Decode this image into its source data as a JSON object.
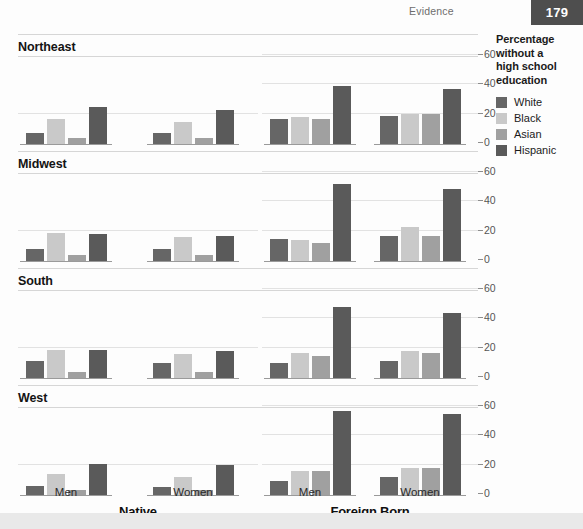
{
  "header": {
    "title": "Evidence",
    "page_number": "179"
  },
  "legend": {
    "title": "Percentage without a high school education",
    "title_lines": [
      "Percentage",
      "without a",
      "high school",
      "education"
    ],
    "items": [
      {
        "label": "White",
        "color": "#666666"
      },
      {
        "label": "Black",
        "color": "#c9c9c9"
      },
      {
        "label": "Asian",
        "color": "#a0a0a0"
      },
      {
        "label": "Hispanic",
        "color": "#5a5a5a"
      }
    ]
  },
  "axis": {
    "ticks": [
      "60",
      "40",
      "20",
      "0"
    ],
    "tick_values": [
      60,
      40,
      20,
      0
    ]
  },
  "bottom_labels": {
    "native": "Native",
    "foreign": "Foreign Born",
    "men": "Men",
    "women": "Women"
  },
  "regions": [
    {
      "name": "Northeast"
    },
    {
      "name": "Midwest"
    },
    {
      "name": "South"
    },
    {
      "name": "West"
    }
  ],
  "chart_data": {
    "type": "bar",
    "xlabel": "",
    "ylabel": "Percentage without a high school education",
    "ylim": [
      0,
      60
    ],
    "yticks": [
      0,
      20,
      40,
      60
    ],
    "grid": true,
    "legend_position": "right",
    "series_names": [
      "White",
      "Black",
      "Asian",
      "Hispanic"
    ],
    "series_colors": [
      "#666666",
      "#c9c9c9",
      "#a0a0a0",
      "#5a5a5a"
    ],
    "panel_rows": [
      "Northeast",
      "Midwest",
      "South",
      "West"
    ],
    "panel_cols": [
      "Native",
      "Foreign Born"
    ],
    "groups": [
      "Men",
      "Women"
    ],
    "panels": [
      {
        "region": "Northeast",
        "nativity": "Native",
        "groups": [
          {
            "group": "Men",
            "values": [
              7,
              17,
              4,
              25
            ]
          },
          {
            "group": "Women",
            "values": [
              7,
              15,
              4,
              23
            ]
          }
        ]
      },
      {
        "region": "Northeast",
        "nativity": "Foreign Born",
        "groups": [
          {
            "group": "Men",
            "values": [
              17,
              18,
              17,
              39
            ]
          },
          {
            "group": "Women",
            "values": [
              19,
              20,
              20,
              37
            ]
          }
        ]
      },
      {
        "region": "Midwest",
        "nativity": "Native",
        "groups": [
          {
            "group": "Men",
            "values": [
              8,
              19,
              4,
              18
            ]
          },
          {
            "group": "Women",
            "values": [
              8,
              16,
              4,
              17
            ]
          }
        ]
      },
      {
        "region": "Midwest",
        "nativity": "Foreign Born",
        "groups": [
          {
            "group": "Men",
            "values": [
              15,
              14,
              12,
              52
            ]
          },
          {
            "group": "Women",
            "values": [
              17,
              23,
              17,
              49
            ]
          }
        ]
      },
      {
        "region": "South",
        "nativity": "Native",
        "groups": [
          {
            "group": "Men",
            "values": [
              11,
              19,
              4,
              19
            ]
          },
          {
            "group": "Women",
            "values": [
              10,
              16,
              4,
              18
            ]
          }
        ]
      },
      {
        "region": "South",
        "nativity": "Foreign Born",
        "groups": [
          {
            "group": "Men",
            "values": [
              10,
              17,
              15,
              48
            ]
          },
          {
            "group": "Women",
            "values": [
              11,
              18,
              17,
              44
            ]
          }
        ]
      },
      {
        "region": "West",
        "nativity": "Native",
        "groups": [
          {
            "group": "Men",
            "values": [
              6,
              14,
              3,
              21
            ]
          },
          {
            "group": "Women",
            "values": [
              5,
              12,
              3,
              20
            ]
          }
        ]
      },
      {
        "region": "West",
        "nativity": "Foreign Born",
        "groups": [
          {
            "group": "Men",
            "values": [
              9,
              16,
              16,
              57
            ]
          },
          {
            "group": "Women",
            "values": [
              12,
              18,
              18,
              55
            ]
          }
        ]
      }
    ]
  }
}
